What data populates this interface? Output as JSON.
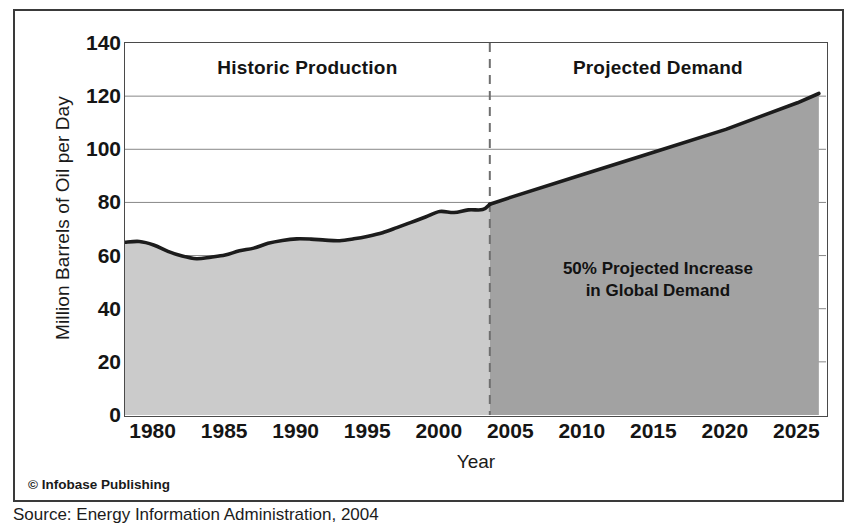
{
  "figure": {
    "copyright": "© Infobase Publishing",
    "source_caption": "Source: Energy Information Administration, 2004"
  },
  "chart_data": {
    "type": "area",
    "title": "",
    "xlabel": "Year",
    "ylabel": "Million Barrels of Oil per Day",
    "xlim": [
      1978,
      2027
    ],
    "ylim": [
      0,
      140
    ],
    "grid": true,
    "legend_position": "none",
    "xticks": [
      1980,
      1985,
      1990,
      1995,
      2000,
      2005,
      2010,
      2015,
      2020,
      2025
    ],
    "xtick_labels": [
      "1980",
      "1985",
      "1990",
      "1995",
      "2000",
      "2005",
      "2010",
      "2015",
      "2020",
      "2025"
    ],
    "yticks": [
      0,
      20,
      40,
      60,
      80,
      100,
      120,
      140
    ],
    "ytick_labels": [
      "0",
      "20",
      "40",
      "60",
      "80",
      "100",
      "120",
      "140"
    ],
    "divider_year": 2003.5,
    "headings": [
      {
        "label": "Historic Production",
        "region": "historic"
      },
      {
        "label": "Projected Demand",
        "region": "projected"
      }
    ],
    "annotations": [
      {
        "label": "50% Projected Increase\nin Global Demand",
        "region": "projected"
      }
    ],
    "colors": {
      "historic_fill": "#cbcbcb",
      "projected_fill": "#a2a2a2",
      "line": "#1c1c1c",
      "grid": "#888888",
      "axis": "#4a4a4a",
      "frame": "#3a3a3a",
      "text": "#151515"
    },
    "series": [
      {
        "name": "Historic Production",
        "region": "historic",
        "x": [
          1978,
          1979,
          1980,
          1981,
          1982,
          1983,
          1984,
          1985,
          1986,
          1987,
          1988,
          1989,
          1990,
          1991,
          1992,
          1993,
          1994,
          1995,
          1996,
          1997,
          1998,
          1999,
          2000,
          2001,
          2002,
          2003,
          2003.5
        ],
        "values": [
          65.0,
          65.3,
          64.0,
          61.6,
          59.8,
          58.8,
          59.4,
          60.2,
          61.8,
          62.8,
          64.6,
          65.7,
          66.3,
          66.2,
          65.8,
          65.6,
          66.3,
          67.3,
          68.6,
          70.5,
          72.5,
          74.5,
          76.6,
          76.2,
          77.2,
          77.3,
          79.3
        ]
      },
      {
        "name": "Projected Demand",
        "region": "projected",
        "x": [
          2003.5,
          2005,
          2010,
          2015,
          2020,
          2025,
          2026.5
        ],
        "values": [
          79.3,
          82.0,
          90.5,
          99.0,
          107.5,
          117.5,
          121.0
        ]
      }
    ]
  }
}
